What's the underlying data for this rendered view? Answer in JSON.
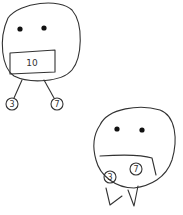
{
  "diagram": {
    "type": "hand-drawn sketch",
    "figures": [
      {
        "name": "monster-with-tree",
        "mouth_label": "10",
        "children": [
          "3",
          "7"
        ]
      },
      {
        "name": "monster-eating-children",
        "held_labels": [
          "3",
          "7"
        ]
      }
    ]
  },
  "colors": {
    "ink": "#333333",
    "paper": "#ffffff"
  }
}
